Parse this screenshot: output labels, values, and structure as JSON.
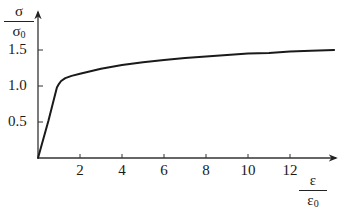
{
  "chart_data": {
    "type": "line",
    "title": "",
    "xlabel": "ε / ε0",
    "ylabel": "σ / σ0",
    "xlabel_parts": {
      "num": "ε",
      "den_base": "ε",
      "den_sub": "0"
    },
    "ylabel_parts": {
      "num": "σ",
      "den_base": "σ",
      "den_sub": "0"
    },
    "x_ticks": [
      2,
      4,
      6,
      8,
      10,
      12
    ],
    "x_tick_labels": [
      "2",
      "4",
      "6",
      "8",
      "10",
      "12"
    ],
    "y_ticks": [
      0.5,
      1.0,
      1.5
    ],
    "y_tick_labels": [
      "0.5",
      "1.0",
      "1.5"
    ],
    "xlim": [
      0,
      14.2
    ],
    "ylim": [
      0,
      2.0
    ],
    "grid": false,
    "legend": null,
    "series": [
      {
        "name": "stress-strain",
        "color": "#1a1a1a",
        "x": [
          0,
          0.5,
          0.9,
          1.0,
          1.1,
          1.3,
          1.6,
          2.0,
          3.0,
          4.0,
          5.0,
          6.0,
          7.0,
          8.0,
          9.0,
          10.0,
          11.0,
          12.0,
          13.0,
          14.1
        ],
        "y": [
          0,
          0.52,
          0.98,
          1.03,
          1.07,
          1.11,
          1.14,
          1.17,
          1.24,
          1.29,
          1.33,
          1.36,
          1.39,
          1.41,
          1.43,
          1.45,
          1.46,
          1.48,
          1.49,
          1.5
        ]
      }
    ]
  }
}
